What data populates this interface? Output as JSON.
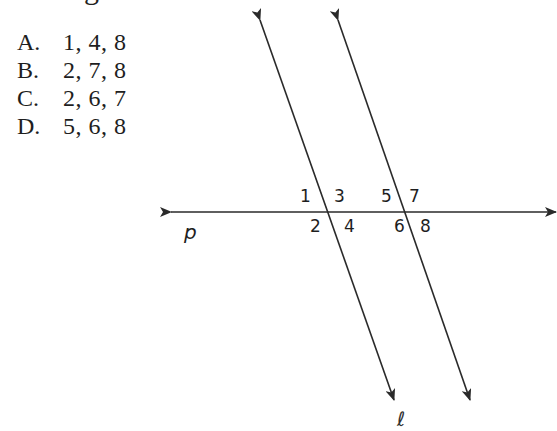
{
  "clipped_text": {
    "top_fragment": "g",
    "bottom_fragment": "ℓ"
  },
  "answer_choices": [
    {
      "letter": "A.",
      "values": "1, 4, 8"
    },
    {
      "letter": "B.",
      "values": "2, 7, 8"
    },
    {
      "letter": "C.",
      "values": "2, 6, 7"
    },
    {
      "letter": "D.",
      "values": "5, 6, 8"
    }
  ],
  "figure": {
    "transversal_label": "p",
    "angle_labels": {
      "a1": "1",
      "a2": "2",
      "a3": "3",
      "a4": "4",
      "a5": "5",
      "a6": "6",
      "a7": "7",
      "a8": "8"
    },
    "stroke_color": "#2a2a2a"
  }
}
